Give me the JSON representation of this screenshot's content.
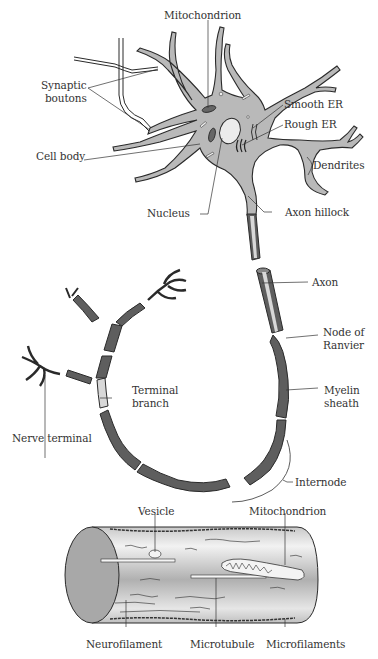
{
  "diagram": {
    "type": "neuron-anatomy",
    "colors": {
      "cell_fill": "#b9b9b9",
      "cell_stroke": "#2a2a2a",
      "myelin_dark": "#5e5e5e",
      "myelin_light": "#d8d8d8",
      "cylinder_end": "#a8a8a8",
      "label_text": "#333333",
      "background": "#ffffff"
    },
    "labels": {
      "mitochondrion_top": "Mitochondrion",
      "synaptic_boutons_1": "Synaptic",
      "synaptic_boutons_2": "boutons",
      "smooth_er": "Smooth ER",
      "rough_er": "Rough ER",
      "cell_body": "Cell body",
      "dendrites": "Dendrites",
      "nucleus": "Nucleus",
      "axon_hillock": "Axon hillock",
      "axon": "Axon",
      "node_of_ranvier_1": "Node of",
      "node_of_ranvier_2": "Ranvier",
      "terminal_branch_1": "Terminal",
      "terminal_branch_2": "branch",
      "myelin_sheath_1": "Myelin",
      "myelin_sheath_2": "sheath",
      "nerve_terminal": "Nerve terminal",
      "internode": "Internode",
      "vesicle": "Vesicle",
      "mitochondrion_bottom": "Mitochondrion",
      "neurofilament": "Neurofilament",
      "microtubule": "Microtubule",
      "microfilaments": "Microfilaments"
    }
  }
}
